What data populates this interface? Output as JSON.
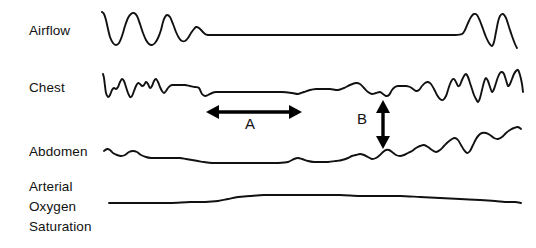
{
  "figure": {
    "background_color": "#ffffff",
    "trace_color": "#111111",
    "marker_color": "#000000",
    "width": 536,
    "height": 248
  },
  "channels": [
    {
      "id": "airflow",
      "label": "Airflow"
    },
    {
      "id": "chest",
      "label": "Chest"
    },
    {
      "id": "abdomen",
      "label": "Abdomen"
    },
    {
      "id": "sao2",
      "label_line1": "Arterial",
      "label_line2": "Oxygen",
      "label_line3": "Saturation"
    }
  ],
  "markers": [
    {
      "id": "a",
      "label": "A",
      "orientation": "horizontal",
      "double_headed": true
    },
    {
      "id": "b",
      "label": "B",
      "orientation": "vertical",
      "double_headed": true
    }
  ],
  "chart_data": {
    "type": "line",
    "xlabel": "",
    "ylabel": "",
    "grid": false,
    "legend": "none",
    "x_range": [
      100,
      520
    ],
    "annotations": [
      {
        "label": "A",
        "type": "double-arrow-horizontal",
        "x1": 206,
        "x2": 302,
        "y": 112,
        "text_x": 250,
        "text_y": 128
      },
      {
        "label": "B",
        "type": "double-arrow-vertical",
        "x": 383,
        "y1": 100,
        "y2": 149,
        "text_x": 364,
        "text_y": 122
      }
    ],
    "series": [
      {
        "name": "Airflow",
        "baseline_y": 35,
        "points": [
          [
            102,
            12
          ],
          [
            104,
            14
          ],
          [
            106,
            20
          ],
          [
            108,
            29
          ],
          [
            110,
            37
          ],
          [
            113,
            43
          ],
          [
            116,
            45
          ],
          [
            119,
            43
          ],
          [
            122,
            36
          ],
          [
            125,
            26
          ],
          [
            128,
            18
          ],
          [
            131,
            14
          ],
          [
            134,
            13
          ],
          [
            137,
            16
          ],
          [
            140,
            24
          ],
          [
            143,
            33
          ],
          [
            146,
            40
          ],
          [
            149,
            44
          ],
          [
            152,
            45
          ],
          [
            155,
            43
          ],
          [
            158,
            38
          ],
          [
            161,
            30
          ],
          [
            163,
            22
          ],
          [
            165,
            17
          ],
          [
            167,
            15
          ],
          [
            170,
            17
          ],
          [
            173,
            24
          ],
          [
            176,
            32
          ],
          [
            179,
            38
          ],
          [
            182,
            41
          ],
          [
            185,
            41
          ],
          [
            188,
            38
          ],
          [
            191,
            33
          ],
          [
            194,
            29
          ],
          [
            196,
            27
          ],
          [
            199,
            28
          ],
          [
            202,
            31
          ],
          [
            205,
            34
          ],
          [
            208,
            35
          ],
          [
            212,
            35
          ],
          [
            230,
            35
          ],
          [
            280,
            35
          ],
          [
            340,
            35
          ],
          [
            400,
            35
          ],
          [
            440,
            35
          ],
          [
            455,
            35
          ],
          [
            462,
            34
          ],
          [
            465,
            30
          ],
          [
            468,
            23
          ],
          [
            471,
            17
          ],
          [
            474,
            14
          ],
          [
            477,
            15
          ],
          [
            480,
            21
          ],
          [
            483,
            29
          ],
          [
            486,
            37
          ],
          [
            489,
            43
          ],
          [
            492,
            46
          ],
          [
            494,
            42
          ],
          [
            496,
            32
          ],
          [
            498,
            22
          ],
          [
            500,
            16
          ],
          [
            503,
            14
          ],
          [
            506,
            18
          ],
          [
            509,
            27
          ],
          [
            512,
            36
          ],
          [
            515,
            44
          ],
          [
            517,
            48
          ]
        ]
      },
      {
        "name": "Chest",
        "baseline_y": 90,
        "points": [
          [
            103,
            74
          ],
          [
            104,
            78
          ],
          [
            105,
            86
          ],
          [
            106,
            93
          ],
          [
            108,
            97
          ],
          [
            110,
            95
          ],
          [
            112,
            90
          ],
          [
            114,
            88
          ],
          [
            116,
            89
          ],
          [
            118,
            87
          ],
          [
            120,
            82
          ],
          [
            122,
            79
          ],
          [
            124,
            81
          ],
          [
            126,
            87
          ],
          [
            128,
            93
          ],
          [
            130,
            97
          ],
          [
            132,
            96
          ],
          [
            134,
            91
          ],
          [
            136,
            86
          ],
          [
            138,
            83
          ],
          [
            140,
            84
          ],
          [
            142,
            86
          ],
          [
            144,
            85
          ],
          [
            146,
            82
          ],
          [
            148,
            84
          ],
          [
            150,
            88
          ],
          [
            152,
            86
          ],
          [
            154,
            81
          ],
          [
            156,
            79
          ],
          [
            158,
            82
          ],
          [
            160,
            87
          ],
          [
            162,
            91
          ],
          [
            164,
            93
          ],
          [
            166,
            91
          ],
          [
            168,
            88
          ],
          [
            170,
            86
          ],
          [
            172,
            85
          ],
          [
            175,
            85
          ],
          [
            178,
            85
          ],
          [
            181,
            85
          ],
          [
            185,
            85
          ],
          [
            190,
            86
          ],
          [
            195,
            87
          ],
          [
            199,
            88
          ],
          [
            202,
            94
          ],
          [
            205,
            96
          ],
          [
            208,
            95
          ],
          [
            212,
            93
          ],
          [
            216,
            92
          ],
          [
            222,
            92
          ],
          [
            232,
            92
          ],
          [
            245,
            92
          ],
          [
            258,
            92
          ],
          [
            270,
            92
          ],
          [
            282,
            92
          ],
          [
            292,
            93
          ],
          [
            298,
            94
          ],
          [
            304,
            92
          ],
          [
            310,
            90
          ],
          [
            316,
            89
          ],
          [
            322,
            89
          ],
          [
            330,
            89
          ],
          [
            338,
            90
          ],
          [
            344,
            88
          ],
          [
            350,
            85
          ],
          [
            356,
            83
          ],
          [
            360,
            84
          ],
          [
            364,
            88
          ],
          [
            368,
            92
          ],
          [
            372,
            94
          ],
          [
            376,
            93
          ],
          [
            380,
            92
          ],
          [
            383,
            94
          ],
          [
            386,
            96
          ],
          [
            389,
            95
          ],
          [
            392,
            90
          ],
          [
            395,
            87
          ],
          [
            398,
            86
          ],
          [
            402,
            86
          ],
          [
            406,
            86
          ],
          [
            410,
            87
          ],
          [
            413,
            89
          ],
          [
            416,
            91
          ],
          [
            419,
            90
          ],
          [
            422,
            86
          ],
          [
            425,
            83
          ],
          [
            428,
            82
          ],
          [
            431,
            84
          ],
          [
            434,
            89
          ],
          [
            437,
            95
          ],
          [
            440,
            99
          ],
          [
            443,
            100
          ],
          [
            446,
            96
          ],
          [
            448,
            90
          ],
          [
            450,
            84
          ],
          [
            452,
            80
          ],
          [
            454,
            79
          ],
          [
            456,
            82
          ],
          [
            458,
            86
          ],
          [
            460,
            85
          ],
          [
            462,
            80
          ],
          [
            464,
            76
          ],
          [
            466,
            74
          ],
          [
            468,
            77
          ],
          [
            470,
            83
          ],
          [
            472,
            89
          ],
          [
            474,
            95
          ],
          [
            476,
            99
          ],
          [
            478,
            102
          ],
          [
            480,
            98
          ],
          [
            482,
            90
          ],
          [
            484,
            82
          ],
          [
            486,
            78
          ],
          [
            488,
            81
          ],
          [
            490,
            87
          ],
          [
            492,
            92
          ],
          [
            494,
            89
          ],
          [
            496,
            83
          ],
          [
            498,
            77
          ],
          [
            500,
            73
          ],
          [
            502,
            72
          ],
          [
            504,
            74
          ],
          [
            506,
            80
          ],
          [
            508,
            86
          ],
          [
            510,
            84
          ],
          [
            512,
            79
          ],
          [
            514,
            74
          ],
          [
            516,
            71
          ],
          [
            518,
            70
          ],
          [
            520,
            75
          ],
          [
            522,
            84
          ],
          [
            523,
            92
          ]
        ]
      },
      {
        "name": "Abdomen",
        "baseline_y": 155,
        "points": [
          [
            104,
            151
          ],
          [
            107,
            149
          ],
          [
            110,
            150
          ],
          [
            113,
            153
          ],
          [
            117,
            155
          ],
          [
            121,
            156
          ],
          [
            125,
            155
          ],
          [
            129,
            152
          ],
          [
            133,
            151
          ],
          [
            137,
            152
          ],
          [
            141,
            155
          ],
          [
            146,
            157
          ],
          [
            151,
            158
          ],
          [
            156,
            158
          ],
          [
            162,
            158
          ],
          [
            168,
            158
          ],
          [
            174,
            158
          ],
          [
            180,
            158
          ],
          [
            186,
            159
          ],
          [
            192,
            160
          ],
          [
            198,
            161
          ],
          [
            204,
            162
          ],
          [
            212,
            163
          ],
          [
            222,
            163
          ],
          [
            232,
            163
          ],
          [
            244,
            163
          ],
          [
            256,
            163
          ],
          [
            268,
            163
          ],
          [
            278,
            163
          ],
          [
            288,
            162
          ],
          [
            294,
            159
          ],
          [
            298,
            158
          ],
          [
            302,
            159
          ],
          [
            308,
            161
          ],
          [
            314,
            162
          ],
          [
            320,
            162
          ],
          [
            328,
            162
          ],
          [
            336,
            161
          ],
          [
            342,
            160
          ],
          [
            348,
            158
          ],
          [
            352,
            156
          ],
          [
            356,
            155
          ],
          [
            360,
            154
          ],
          [
            364,
            155
          ],
          [
            368,
            157
          ],
          [
            372,
            159
          ],
          [
            376,
            158
          ],
          [
            380,
            155
          ],
          [
            383,
            152
          ],
          [
            386,
            150
          ],
          [
            389,
            150
          ],
          [
            392,
            152
          ],
          [
            396,
            155
          ],
          [
            400,
            156
          ],
          [
            404,
            155
          ],
          [
            408,
            153
          ],
          [
            412,
            151
          ],
          [
            416,
            148
          ],
          [
            420,
            146
          ],
          [
            424,
            145
          ],
          [
            428,
            147
          ],
          [
            432,
            150
          ],
          [
            436,
            152
          ],
          [
            440,
            150
          ],
          [
            444,
            146
          ],
          [
            448,
            142
          ],
          [
            452,
            139
          ],
          [
            455,
            138
          ],
          [
            458,
            140
          ],
          [
            461,
            145
          ],
          [
            464,
            150
          ],
          [
            467,
            153
          ],
          [
            470,
            151
          ],
          [
            473,
            145
          ],
          [
            476,
            139
          ],
          [
            479,
            135
          ],
          [
            482,
            133
          ],
          [
            486,
            133
          ],
          [
            490,
            135
          ],
          [
            494,
            138
          ],
          [
            498,
            139
          ],
          [
            502,
            137
          ],
          [
            506,
            133
          ],
          [
            510,
            130
          ],
          [
            514,
            128
          ],
          [
            518,
            127
          ],
          [
            521,
            129
          ]
        ]
      },
      {
        "name": "Arterial Oxygen Saturation",
        "baseline_y": 201,
        "points": [
          [
            109,
            203
          ],
          [
            130,
            203
          ],
          [
            150,
            203
          ],
          [
            170,
            203
          ],
          [
            190,
            202
          ],
          [
            205,
            202
          ],
          [
            218,
            201
          ],
          [
            228,
            199
          ],
          [
            238,
            197
          ],
          [
            250,
            196
          ],
          [
            264,
            195
          ],
          [
            280,
            195
          ],
          [
            300,
            195
          ],
          [
            320,
            195
          ],
          [
            340,
            195
          ],
          [
            360,
            196
          ],
          [
            380,
            196
          ],
          [
            400,
            196
          ],
          [
            420,
            197
          ],
          [
            440,
            198
          ],
          [
            460,
            199
          ],
          [
            480,
            200
          ],
          [
            495,
            201
          ],
          [
            505,
            202
          ],
          [
            515,
            202
          ],
          [
            521,
            203
          ]
        ]
      }
    ]
  }
}
